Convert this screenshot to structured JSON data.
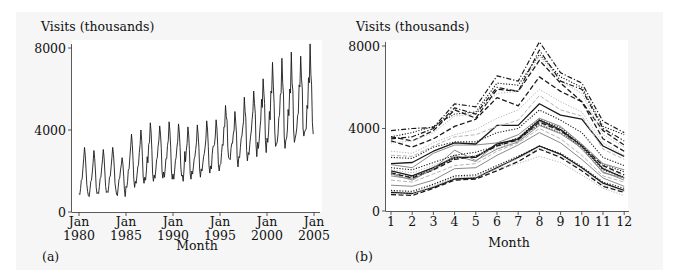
{
  "figure": {
    "panel_a_label": "(a)",
    "panel_b_label": "(b)"
  },
  "chart_data": [
    {
      "type": "line",
      "panel": "(a)",
      "title": "",
      "ylabel": "Visits (thousands)",
      "xlabel": "Month",
      "ylim": [
        0,
        8000
      ],
      "yticks": [
        0,
        4000,
        8000
      ],
      "xticks": [
        "Jan 1980",
        "Jan 1985",
        "Jan 1990",
        "Jan 1995",
        "Jan 2000",
        "Jan 2005"
      ],
      "xtick_years": [
        1980,
        1985,
        1990,
        1995,
        2000,
        2005
      ],
      "xlim": [
        1980,
        2005.1
      ],
      "grid": false,
      "legend": null,
      "description": "Monthly visits, Jan 1980 to Dec 2004, constructed as concatenation of yearly series in panel (b)",
      "series_source": "years"
    },
    {
      "type": "line",
      "panel": "(b)",
      "title": "",
      "ylabel": "Visits (thousands)",
      "xlabel": "Month",
      "ylim": [
        0,
        8000
      ],
      "yticks": [
        0,
        4000,
        8000
      ],
      "categories": [
        1,
        2,
        3,
        4,
        5,
        6,
        7,
        8,
        9,
        10,
        11,
        12
      ],
      "grid": false,
      "legend": null,
      "years": [
        {
          "year": 1980,
          "style": "solid-dark",
          "values": [
            900,
            850,
            1150,
            1550,
            1600,
            2100,
            2600,
            3150,
            2750,
            2100,
            1350,
            1000
          ]
        },
        {
          "year": 1981,
          "style": "dashed-dark",
          "values": [
            800,
            750,
            1100,
            1500,
            1550,
            1950,
            2400,
            3000,
            2600,
            1950,
            1200,
            900
          ]
        },
        {
          "year": 1982,
          "style": "dotted-grey",
          "values": [
            950,
            900,
            1250,
            1650,
            1700,
            2150,
            2550,
            3050,
            2650,
            2000,
            1250,
            950
          ]
        },
        {
          "year": 1983,
          "style": "dotted-dark",
          "values": [
            1000,
            950,
            1300,
            1700,
            1750,
            2200,
            2650,
            3150,
            2800,
            2150,
            1400,
            1100
          ]
        },
        {
          "year": 1984,
          "style": "dotted-grey",
          "values": [
            850,
            800,
            1200,
            1600,
            1650,
            2050,
            2300,
            2650,
            2350,
            1750,
            1100,
            750
          ]
        },
        {
          "year": 1985,
          "style": "solid-grey",
          "values": [
            1250,
            1200,
            1500,
            2050,
            2100,
            2700,
            3200,
            3800,
            3300,
            2500,
            1600,
            1200
          ]
        },
        {
          "year": 1986,
          "style": "dashed-grey",
          "values": [
            1500,
            1400,
            1800,
            2200,
            2300,
            2900,
            3300,
            4000,
            3500,
            2700,
            1700,
            1400
          ]
        },
        {
          "year": 1987,
          "style": "solid-grey",
          "values": [
            1700,
            1550,
            2000,
            2700,
            2400,
            3300,
            3400,
            4350,
            3900,
            3000,
            1900,
            1500
          ]
        },
        {
          "year": 1988,
          "style": "dotted-dark",
          "values": [
            1800,
            1650,
            2050,
            2550,
            2650,
            3200,
            3500,
            4200,
            3800,
            3100,
            2000,
            1650
          ]
        },
        {
          "year": 1989,
          "style": "solid-dark",
          "values": [
            1950,
            1700,
            2100,
            2600,
            2600,
            3250,
            3500,
            4400,
            3950,
            3150,
            2050,
            1600
          ]
        },
        {
          "year": 1990,
          "style": "dashed-dark",
          "values": [
            1850,
            1600,
            2000,
            2500,
            2650,
            3150,
            3450,
            4300,
            3900,
            3150,
            2200,
            1750
          ]
        },
        {
          "year": 1991,
          "style": "solid-grey",
          "values": [
            1800,
            1500,
            2050,
            2950,
            2450,
            3000,
            3350,
            4150,
            3750,
            3050,
            1850,
            1600
          ]
        },
        {
          "year": 1992,
          "style": "dotted-grey",
          "values": [
            2000,
            1850,
            2200,
            2600,
            2700,
            3050,
            3400,
            4250,
            3800,
            3150,
            2100,
            1700
          ]
        },
        {
          "year": 1993,
          "style": "dotted-dark",
          "values": [
            2100,
            2000,
            2350,
            2700,
            2850,
            3150,
            3550,
            4450,
            4050,
            3200,
            2250,
            1900
          ]
        },
        {
          "year": 1994,
          "style": "solid-grey",
          "values": [
            2250,
            2100,
            2800,
            3200,
            3200,
            3300,
            3700,
            4500,
            4100,
            3250,
            2300,
            2000
          ]
        },
        {
          "year": 1995,
          "style": "solid-dark",
          "values": [
            2300,
            2350,
            2900,
            3300,
            3250,
            4150,
            4150,
            5200,
            4650,
            4450,
            3150,
            2650
          ]
        },
        {
          "year": 1996,
          "style": "dotted-dark",
          "values": [
            2600,
            2550,
            3100,
            3350,
            3350,
            3800,
            4000,
            4900,
            4400,
            3800,
            2600,
            2200
          ]
        },
        {
          "year": 1997,
          "style": "dashed-grey",
          "values": [
            2700,
            2650,
            3150,
            3600,
            3700,
            4100,
            4400,
            5600,
            4900,
            4600,
            3000,
            2500
          ]
        },
        {
          "year": 1998,
          "style": "dotted-grey",
          "values": [
            2900,
            2800,
            3300,
            3700,
            3950,
            4500,
            4900,
            5900,
            5300,
            4800,
            3300,
            2700
          ]
        },
        {
          "year": 1999,
          "style": "dashed-dark",
          "values": [
            3400,
            3100,
            3500,
            4100,
            4450,
            5500,
            5100,
            6500,
            5800,
            5300,
            3500,
            2900
          ]
        },
        {
          "year": 2000,
          "style": "dashed-dark",
          "values": [
            3600,
            3400,
            3900,
            4900,
            4500,
            5900,
            5800,
            7300,
            6200,
            5300,
            3900,
            3200
          ]
        },
        {
          "year": 2001,
          "style": "dotted-grey",
          "values": [
            3300,
            3400,
            3800,
            4600,
            4700,
            5700,
            5800,
            7500,
            6300,
            5700,
            3700,
            3100
          ]
        },
        {
          "year": 2002,
          "style": "dashdot-dark",
          "values": [
            3500,
            3600,
            4000,
            5000,
            4700,
            6000,
            5800,
            7800,
            6300,
            5900,
            4000,
            3400
          ]
        },
        {
          "year": 2003,
          "style": "dotted-dark",
          "values": [
            3600,
            3800,
            4100,
            4700,
            4800,
            6200,
            6100,
            7600,
            6500,
            6000,
            4100,
            3700
          ]
        },
        {
          "year": 2004,
          "style": "dashdot-dark",
          "values": [
            3900,
            4000,
            4050,
            5200,
            5050,
            6550,
            6300,
            8200,
            6700,
            6200,
            4350,
            3800
          ]
        }
      ]
    }
  ],
  "axes": {
    "a": {
      "ylabel": "Visits (thousands)",
      "xlabel": "Month",
      "ytick_labels": [
        "0",
        "4000",
        "8000"
      ],
      "xtick_top": [
        "Jan",
        "Jan",
        "Jan",
        "Jan",
        "Jan",
        "Jan"
      ],
      "xtick_bottom": [
        "1980",
        "1985",
        "1990",
        "1995",
        "2000",
        "2005"
      ]
    },
    "b": {
      "ylabel": "Visits (thousands)",
      "xlabel": "Month",
      "ytick_labels": [
        "0",
        "4000",
        "8000"
      ],
      "xtick_labels": [
        "1",
        "2",
        "3",
        "4",
        "5",
        "6",
        "7",
        "8",
        "9",
        "10",
        "11",
        "12"
      ]
    }
  },
  "colors": {
    "ink": "#111111",
    "dark": "#1a1a1a",
    "grey": "#8a8a8a",
    "lightgrey": "#b5b5b5",
    "panel_bg": "#f6f6f6",
    "plot_bg": "#ffffff"
  }
}
